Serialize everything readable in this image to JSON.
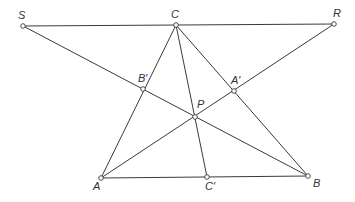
{
  "diagram": {
    "type": "geometry",
    "colors": {
      "line": "#3a3a3a",
      "point_fill": "#ffffff",
      "label": "#333333",
      "background": "#ffffff"
    },
    "points": [
      {
        "id": "S",
        "label": "S",
        "x": 23,
        "y": 26,
        "lx": 18,
        "ly": 19
      },
      {
        "id": "C",
        "label": "C",
        "x": 176,
        "y": 25,
        "lx": 171,
        "ly": 18
      },
      {
        "id": "R",
        "label": "R",
        "x": 334,
        "y": 24,
        "lx": 333,
        "ly": 17
      },
      {
        "id": "Bp",
        "label": "B′",
        "x": 143,
        "y": 89,
        "lx": 138,
        "ly": 82
      },
      {
        "id": "Ap",
        "label": "A′",
        "x": 234,
        "y": 91,
        "lx": 231,
        "ly": 84
      },
      {
        "id": "P",
        "label": "P",
        "x": 195,
        "y": 117,
        "lx": 197,
        "ly": 108
      },
      {
        "id": "A",
        "label": "A",
        "x": 101,
        "y": 178,
        "lx": 93,
        "ly": 190
      },
      {
        "id": "Cp",
        "label": "C′",
        "x": 207,
        "y": 177,
        "lx": 205,
        "ly": 190
      },
      {
        "id": "B",
        "label": "B",
        "x": 308,
        "y": 176,
        "lx": 313,
        "ly": 187
      }
    ],
    "segments": [
      [
        "S",
        "R"
      ],
      [
        "S",
        "B"
      ],
      [
        "R",
        "A"
      ],
      [
        "A",
        "B"
      ],
      [
        "A",
        "C"
      ],
      [
        "C",
        "B"
      ],
      [
        "C",
        "Cp"
      ]
    ]
  }
}
